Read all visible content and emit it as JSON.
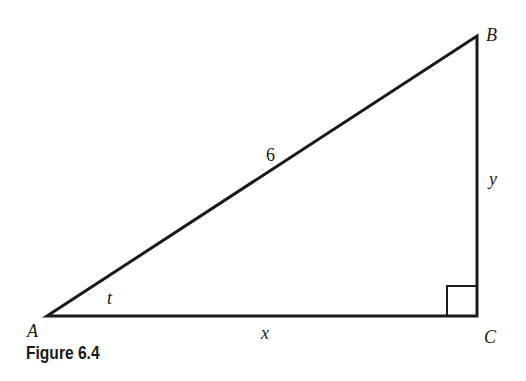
{
  "figure": {
    "caption": "Figure 6.4",
    "vertices": {
      "A": "A",
      "B": "B",
      "C": "C"
    },
    "sides": {
      "hypotenuse": "6",
      "horizontal": "x",
      "vertical": "y"
    },
    "angle_label": "t",
    "right_angle_at": "C",
    "stroke_color": "#1a1a1a"
  }
}
